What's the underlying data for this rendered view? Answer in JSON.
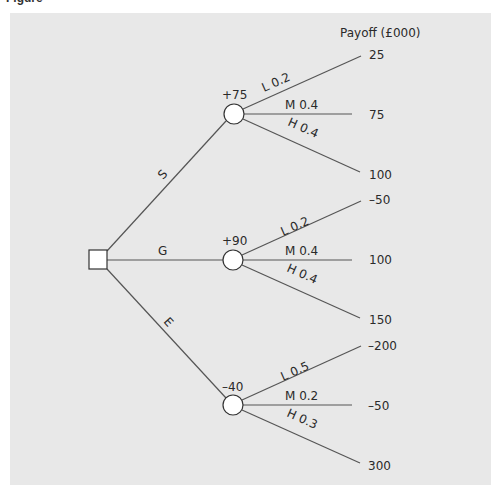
{
  "caption": "Figure",
  "payoff_header": "Payoff (£000)",
  "decision_node": {
    "x": 98,
    "y": 260
  },
  "main_branches": [
    {
      "label": "S",
      "emv": "+75",
      "node": {
        "x": 234,
        "y": 114
      },
      "outcomes": [
        {
          "label": "L 0.2",
          "payoff": "25"
        },
        {
          "label": "M 0.4",
          "payoff": "75"
        },
        {
          "label": "H 0.4",
          "payoff": "100"
        }
      ]
    },
    {
      "label": "G",
      "emv": "+90",
      "node": {
        "x": 233,
        "y": 260
      },
      "outcomes": [
        {
          "label": "L 0.2",
          "payoff": "–50"
        },
        {
          "label": "M 0.4",
          "payoff": "100"
        },
        {
          "label": "H 0.4",
          "payoff": "150"
        }
      ]
    },
    {
      "label": "E",
      "emv": "–40",
      "node": {
        "x": 233,
        "y": 405
      },
      "outcomes": [
        {
          "label": "L 0.5",
          "payoff": "–200"
        },
        {
          "label": "M 0.2",
          "payoff": "–50"
        },
        {
          "label": "H 0.3",
          "payoff": "300"
        }
      ]
    }
  ],
  "colors": {
    "panel": "#e8e8e8",
    "line": "#555555",
    "node_fill": "#ffffff",
    "node_stroke": "#333333"
  }
}
